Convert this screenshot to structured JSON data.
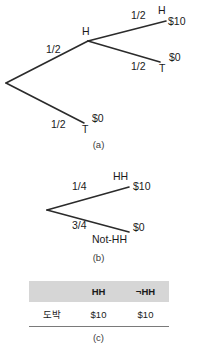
{
  "figure_a": {
    "caption": "(a)",
    "root_label": "",
    "branches": [
      {
        "id": "root-to-h",
        "probability": "1/2",
        "outcome": "H",
        "payoff": ""
      },
      {
        "id": "h-to-hh",
        "probability": "1/2",
        "outcome": "H",
        "payoff": "$10"
      },
      {
        "id": "h-to-ht",
        "probability": "1/2",
        "outcome": "T",
        "payoff": "$0"
      },
      {
        "id": "root-to-t",
        "probability": "1/2",
        "outcome": "T",
        "payoff": "$0"
      }
    ]
  },
  "figure_b": {
    "caption": "(b)",
    "branches": [
      {
        "id": "hh",
        "probability": "1/4",
        "outcome": "HH",
        "payoff": "$10"
      },
      {
        "id": "not-hh",
        "probability": "3/4",
        "outcome": "Not-HH",
        "payoff": "$0"
      }
    ]
  },
  "figure_c": {
    "caption": "(c)",
    "table": {
      "corner_header": "",
      "column_headers": [
        "HH",
        "¬HH"
      ],
      "rows": [
        {
          "label": "도박",
          "values": [
            "$10",
            "$10"
          ]
        }
      ]
    }
  },
  "colors": {
    "line": "#2b2b2b",
    "text": "#1a1a1a",
    "table_header_bg": "#d6d6d6",
    "table_rule": "#7a7a7a",
    "background": "#ffffff"
  }
}
